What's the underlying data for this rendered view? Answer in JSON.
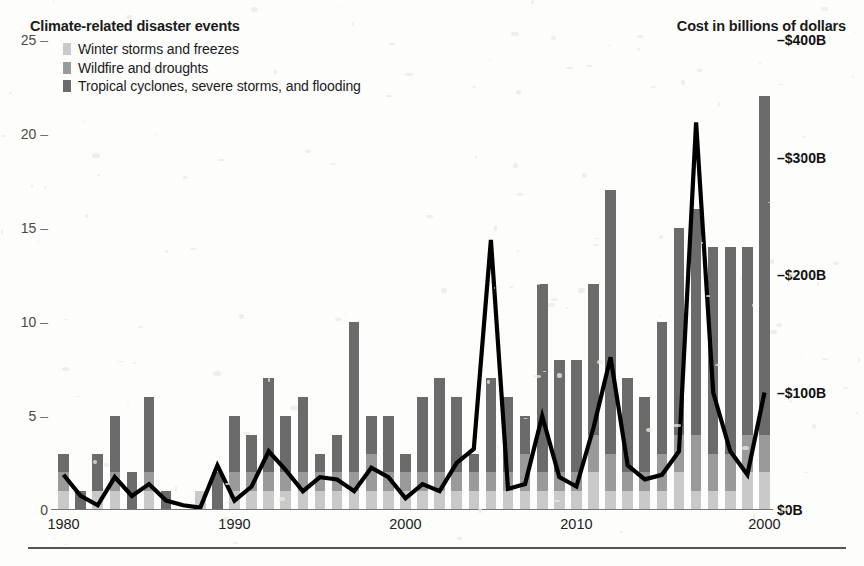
{
  "header": {
    "left_title": "Climate-related disaster events",
    "right_title": "Cost in billions of dollars"
  },
  "legend": {
    "items": [
      {
        "label": "Winter storms and freezes",
        "color": "#c9c9c9"
      },
      {
        "label": "Wildfire and droughts",
        "color": "#9a9a9a"
      },
      {
        "label": "Tropical cyclones, severe storms, and flooding",
        "color": "#6b6b6b"
      }
    ]
  },
  "axes": {
    "left_ticks": [
      "25",
      "20",
      "15",
      "10",
      "5",
      "0"
    ],
    "right_ticks": [
      "$400B",
      "$300B",
      "$200B",
      "$100B",
      "$0B"
    ],
    "right_tick_prefix": "–",
    "x_ticks": [
      "1980",
      "1990",
      "2000",
      "2010",
      "2000"
    ]
  },
  "chart_data": {
    "type": "bar",
    "title": "Climate-related disaster events",
    "subtitle": "Cost in billions of dollars",
    "xlabel": "",
    "ylabel": "Climate-related disaster events",
    "y2label": "Cost in billions of dollars",
    "ylim": [
      0,
      25
    ],
    "y2lim": [
      0,
      400
    ],
    "grid": false,
    "legend_position": "top-left",
    "stacked": true,
    "categories": [
      1980,
      1981,
      1982,
      1983,
      1984,
      1985,
      1986,
      1987,
      1988,
      1989,
      1990,
      1991,
      1992,
      1993,
      1994,
      1995,
      1996,
      1997,
      1998,
      1999,
      2000,
      2001,
      2002,
      2003,
      2004,
      2005,
      2006,
      2007,
      2008,
      2009,
      2010,
      2011,
      2012,
      2013,
      2014,
      2015,
      2016,
      2017,
      2018,
      2019,
      2020,
      2021
    ],
    "x_tick_values": [
      1980,
      1990,
      2000,
      2010,
      2021
    ],
    "x_tick_labels": [
      "1980",
      "1990",
      "2000",
      "2010",
      "2000"
    ],
    "series": [
      {
        "name": "Winter storms and freezes",
        "color": "#c9c9c9",
        "values": [
          1,
          0,
          1,
          1,
          0,
          1,
          0,
          0,
          1,
          0,
          1,
          1,
          1,
          1,
          1,
          1,
          1,
          1,
          1,
          1,
          1,
          1,
          1,
          1,
          1,
          1,
          1,
          1,
          1,
          1,
          1,
          2,
          1,
          1,
          1,
          1,
          2,
          1,
          1,
          1,
          2,
          2
        ]
      },
      {
        "name": "Wildfire and droughts",
        "color": "#9a9a9a",
        "values": [
          1,
          0,
          0,
          1,
          0,
          1,
          0,
          0,
          0,
          0,
          1,
          1,
          1,
          1,
          1,
          1,
          1,
          1,
          2,
          1,
          1,
          1,
          1,
          1,
          1,
          1,
          1,
          2,
          1,
          1,
          1,
          2,
          2,
          1,
          1,
          2,
          2,
          3,
          2,
          2,
          2,
          2
        ]
      },
      {
        "name": "Tropical cyclones, severe storms, and flooding",
        "color": "#6b6b6b",
        "values": [
          1,
          1,
          2,
          3,
          2,
          4,
          1,
          0,
          0,
          2,
          3,
          2,
          5,
          3,
          4,
          1,
          2,
          8,
          2,
          3,
          1,
          4,
          5,
          4,
          1,
          5,
          4,
          2,
          10,
          6,
          6,
          8,
          14,
          5,
          4,
          7,
          11,
          12,
          11,
          11,
          10,
          18
        ]
      }
    ],
    "totals": [
      3,
      1,
      3,
      5,
      2,
      6,
      1,
      0,
      1,
      2,
      5,
      4,
      7,
      5,
      6,
      3,
      4,
      10,
      5,
      5,
      3,
      6,
      7,
      6,
      3,
      7,
      6,
      5,
      12,
      8,
      8,
      12,
      17,
      7,
      6,
      10,
      15,
      16,
      14,
      14,
      14,
      22
    ],
    "line_series": {
      "name": "Cost in billions of dollars",
      "color": "#000000",
      "unit": "billion USD",
      "axis": "right",
      "values": [
        30,
        12,
        4,
        28,
        12,
        22,
        8,
        4,
        2,
        38,
        8,
        20,
        50,
        34,
        16,
        28,
        26,
        16,
        36,
        28,
        10,
        22,
        16,
        40,
        52,
        230,
        18,
        22,
        80,
        28,
        20,
        70,
        130,
        38,
        26,
        30,
        50,
        330,
        100,
        50,
        30,
        100
      ]
    }
  }
}
